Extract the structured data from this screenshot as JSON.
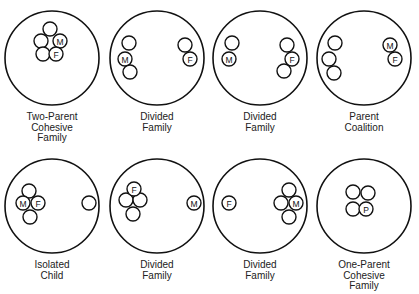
{
  "colors": {
    "stroke": "#111111",
    "background": "#ffffff",
    "text": "#222222"
  },
  "diagrams": [
    {
      "caption": [
        "Two-Parent",
        "Cohesive",
        "Family"
      ],
      "circle": {
        "cx": 52,
        "cy": 58,
        "r": 47
      },
      "members": [
        {
          "cx": 50,
          "cy": 29,
          "label": ""
        },
        {
          "cx": 41,
          "cy": 41,
          "label": ""
        },
        {
          "cx": 60,
          "cy": 41,
          "label": "M"
        },
        {
          "cx": 43,
          "cy": 54,
          "label": ""
        },
        {
          "cx": 56,
          "cy": 54,
          "label": "F"
        }
      ]
    },
    {
      "caption": [
        "Divided",
        "Family"
      ],
      "circle": {
        "cx": 157,
        "cy": 58,
        "r": 47
      },
      "members": [
        {
          "cx": 129,
          "cy": 43,
          "label": ""
        },
        {
          "cx": 125,
          "cy": 59,
          "label": "M"
        },
        {
          "cx": 130,
          "cy": 72,
          "label": ""
        },
        {
          "cx": 185,
          "cy": 45,
          "label": ""
        },
        {
          "cx": 190,
          "cy": 59,
          "label": "F"
        }
      ]
    },
    {
      "caption": [
        "Divided",
        "Family"
      ],
      "circle": {
        "cx": 260,
        "cy": 58,
        "r": 47
      },
      "members": [
        {
          "cx": 232,
          "cy": 43,
          "label": ""
        },
        {
          "cx": 229,
          "cy": 59,
          "label": "M"
        },
        {
          "cx": 287,
          "cy": 45,
          "label": ""
        },
        {
          "cx": 284,
          "cy": 71,
          "label": ""
        },
        {
          "cx": 292,
          "cy": 59,
          "label": "F"
        }
      ]
    },
    {
      "caption": [
        "Parent",
        "Coalition"
      ],
      "circle": {
        "cx": 364,
        "cy": 58,
        "r": 47
      },
      "members": [
        {
          "cx": 335,
          "cy": 43,
          "label": ""
        },
        {
          "cx": 329,
          "cy": 59,
          "label": ""
        },
        {
          "cx": 334,
          "cy": 73,
          "label": ""
        },
        {
          "cx": 390,
          "cy": 45,
          "label": "M"
        },
        {
          "cx": 395,
          "cy": 59,
          "label": "F"
        }
      ]
    },
    {
      "caption": [
        "Isolated",
        "Child"
      ],
      "circle": {
        "cx": 52,
        "cy": 206,
        "r": 47
      },
      "members": [
        {
          "cx": 29,
          "cy": 191,
          "label": ""
        },
        {
          "cx": 30,
          "cy": 217,
          "label": ""
        },
        {
          "cx": 23,
          "cy": 203,
          "label": "M"
        },
        {
          "cx": 38,
          "cy": 203,
          "label": "F"
        },
        {
          "cx": 89,
          "cy": 203,
          "label": ""
        }
      ]
    },
    {
      "caption": [
        "Divided",
        "Family"
      ],
      "circle": {
        "cx": 157,
        "cy": 206,
        "r": 47
      },
      "members": [
        {
          "cx": 126,
          "cy": 200,
          "label": ""
        },
        {
          "cx": 140,
          "cy": 200,
          "label": ""
        },
        {
          "cx": 133,
          "cy": 214,
          "label": ""
        },
        {
          "cx": 134,
          "cy": 189,
          "label": "F"
        },
        {
          "cx": 194,
          "cy": 203,
          "label": "M"
        }
      ]
    },
    {
      "caption": [
        "Divided",
        "Family"
      ],
      "circle": {
        "cx": 260,
        "cy": 206,
        "r": 47
      },
      "members": [
        {
          "cx": 229,
          "cy": 203,
          "label": "F"
        },
        {
          "cx": 289,
          "cy": 190,
          "label": ""
        },
        {
          "cx": 281,
          "cy": 203,
          "label": ""
        },
        {
          "cx": 289,
          "cy": 217,
          "label": ""
        },
        {
          "cx": 296,
          "cy": 203,
          "label": "M"
        }
      ]
    },
    {
      "caption": [
        "One-Parent",
        "Cohesive",
        "Family"
      ],
      "circle": {
        "cx": 364,
        "cy": 206,
        "r": 47
      },
      "members": [
        {
          "cx": 353,
          "cy": 192,
          "label": ""
        },
        {
          "cx": 368,
          "cy": 193,
          "label": ""
        },
        {
          "cx": 353,
          "cy": 209,
          "label": ""
        },
        {
          "cx": 366,
          "cy": 209,
          "label": "P"
        }
      ]
    }
  ]
}
